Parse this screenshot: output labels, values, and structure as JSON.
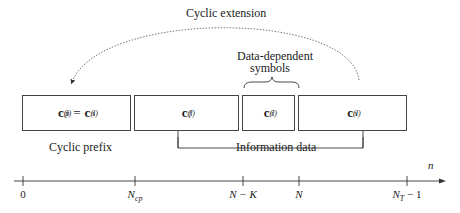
{
  "diagram": {
    "title_arc": "Cyclic extension",
    "brace_label_line1": "Data-dependent",
    "brace_label_line2": "symbols",
    "cyclic_prefix_label": "Cyclic prefix",
    "information_data_label": "Information data",
    "boxes": [
      {
        "symbol": "c",
        "sub": "p",
        "sup": "(l)",
        "eq": "=",
        "symbol2": "c",
        "sub2": "s",
        "sup2": "(l)"
      },
      {
        "symbol": "c",
        "sub": "f",
        "sup": "(l)"
      },
      {
        "symbol": "c",
        "sub": "i",
        "sup": "(l)"
      },
      {
        "symbol": "c",
        "sub": "s",
        "sup": "(l)"
      }
    ],
    "axis": {
      "variable": "n",
      "ticks": [
        {
          "main": "0",
          "sub": ""
        },
        {
          "main": "N",
          "sub": "cp"
        },
        {
          "main": "N − K",
          "sub": ""
        },
        {
          "main": "N",
          "sub": ""
        },
        {
          "main": "N",
          "sub": "T",
          "suffix": " − 1"
        }
      ]
    }
  }
}
